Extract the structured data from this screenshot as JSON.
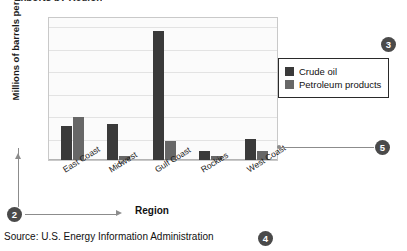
{
  "figure": {
    "clipped_title_fragment": "Exports by Region",
    "source_note": "Source: U.S. Energy Information Administration"
  },
  "chart_data": {
    "type": "bar",
    "title": "",
    "xlabel": "Region",
    "ylabel": "Millions of barrels per day",
    "categories": [
      "East Coast",
      "Midwest",
      "Gulf Coast",
      "Rockies",
      "West Coast"
    ],
    "series": [
      {
        "name": "Crude oil",
        "color": "#3a3a3a",
        "values": [
          1.5,
          1.6,
          5.75,
          0.4,
          0.95
        ]
      },
      {
        "name": "Petroleum products",
        "color": "#676767",
        "values": [
          1.9,
          0.2,
          0.85,
          0.2,
          0.4
        ]
      }
    ],
    "ylim": [
      0,
      6.4
    ],
    "yticks": [
      0,
      1,
      2,
      3,
      4,
      5,
      6
    ],
    "grid": true,
    "legend_position": "right"
  },
  "legend": {
    "items": [
      {
        "label": "Crude oil",
        "color": "#3a3a3a"
      },
      {
        "label": "Petroleum products",
        "color": "#676767"
      }
    ]
  },
  "callouts": [
    {
      "id": "callout-2",
      "number": "2"
    },
    {
      "id": "callout-3",
      "number": "3"
    },
    {
      "id": "callout-4",
      "number": "4"
    },
    {
      "id": "callout-5",
      "number": "5"
    }
  ]
}
